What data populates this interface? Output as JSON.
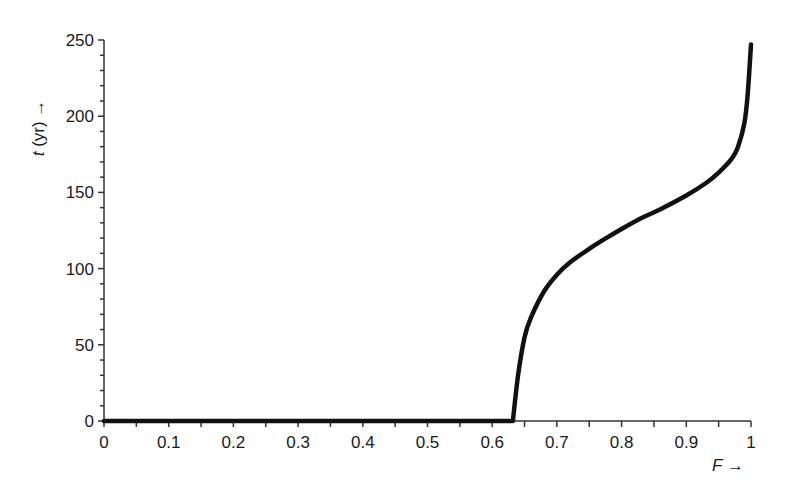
{
  "chart_data": {
    "type": "line",
    "title": "",
    "xlabel": "F →",
    "ylabel": "t (yr) →",
    "xlim": [
      0,
      1
    ],
    "ylim": [
      0,
      250
    ],
    "grid": false,
    "legend": null,
    "x_ticks": [
      "0",
      "0.1",
      "0.2",
      "0.3",
      "0.4",
      "0.5",
      "0.6",
      "0.7",
      "0.8",
      "0.9",
      "1"
    ],
    "y_ticks": [
      "0",
      "50",
      "100",
      "150",
      "200",
      "250"
    ],
    "series": [
      {
        "name": "t(F)",
        "x": [
          0,
          0.1,
          0.2,
          0.3,
          0.4,
          0.5,
          0.6,
          0.632,
          0.64,
          0.65,
          0.66,
          0.68,
          0.7,
          0.72,
          0.75,
          0.78,
          0.8,
          0.83,
          0.86,
          0.9,
          0.93,
          0.95,
          0.97,
          0.98,
          0.99,
          0.995,
          1.0
        ],
        "y": [
          0,
          0,
          0,
          0,
          0,
          0,
          0,
          0,
          30,
          55,
          68,
          85,
          96,
          104,
          113,
          121,
          126,
          133,
          139,
          148,
          156,
          163,
          172,
          180,
          196,
          215,
          247
        ]
      }
    ]
  },
  "axes": {
    "x_label_main": "F",
    "x_label_arrow": " →",
    "y_label_main": "t",
    "y_label_rest": " (yr) →"
  }
}
